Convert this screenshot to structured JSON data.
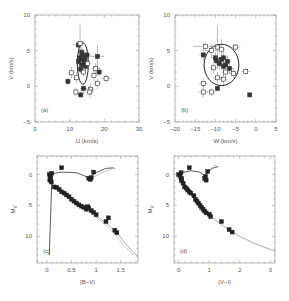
{
  "chart_data": [
    {
      "id": "a",
      "type": "scatter",
      "panel_label": "(a)",
      "xlabel": "U (km/s)",
      "ylabel": "V (km/s)",
      "xlim": [
        0,
        30
      ],
      "ylim": [
        -5,
        10
      ],
      "xticks": [
        0,
        10,
        20,
        30
      ],
      "yticks": [
        -5,
        0,
        5,
        10
      ],
      "box": {
        "left": 35,
        "top": 15,
        "right": 139,
        "bottom": 122
      },
      "ellipse": {
        "cx": 13.8,
        "cy": 3.2,
        "rx": 1.6,
        "ry": 2.9
      },
      "points": [
        {
          "x": 12.5,
          "y": 5.8,
          "ex": 1.5,
          "ey": 0.6,
          "filled": true
        },
        {
          "x": 13.0,
          "y": 6.0,
          "ex": 0.6,
          "ey": 2.6,
          "filled": false
        },
        {
          "x": 13.5,
          "y": 4.8,
          "ex": 0.8,
          "ey": 0.8,
          "filled": true
        },
        {
          "x": 14.0,
          "y": 4.2,
          "ex": 1.0,
          "ey": 0.7,
          "filled": true
        },
        {
          "x": 13.8,
          "y": 3.8,
          "ex": 0.9,
          "ey": 0.8,
          "filled": true
        },
        {
          "x": 14.2,
          "y": 3.4,
          "ex": 0.8,
          "ey": 0.6,
          "filled": true
        },
        {
          "x": 13.4,
          "y": 3.0,
          "ex": 0.7,
          "ey": 0.6,
          "filled": true
        },
        {
          "x": 14.6,
          "y": 2.8,
          "ex": 0.9,
          "ey": 0.7,
          "filled": true
        },
        {
          "x": 13.2,
          "y": 2.4,
          "ex": 0.8,
          "ey": 0.6,
          "filled": true
        },
        {
          "x": 14.0,
          "y": 2.0,
          "ex": 0.7,
          "ey": 0.6,
          "filled": false
        },
        {
          "x": 15.0,
          "y": 4.4,
          "ex": 1.2,
          "ey": 0.8,
          "filled": true
        },
        {
          "x": 18.0,
          "y": 4.2,
          "ex": 2.0,
          "ey": 1.6,
          "filled": true
        },
        {
          "x": 17.5,
          "y": 2.5,
          "ex": 1.2,
          "ey": 0.8,
          "filled": false
        },
        {
          "x": 18.5,
          "y": 2.0,
          "ex": 1.0,
          "ey": 0.7,
          "filled": true
        },
        {
          "x": 17.0,
          "y": 1.5,
          "ex": 1.0,
          "ey": 0.8,
          "filled": false
        },
        {
          "x": 20.5,
          "y": 1.1,
          "ex": 1.5,
          "ey": 0.6,
          "filled": false
        },
        {
          "x": 18.0,
          "y": 0.4,
          "ex": 1.0,
          "ey": 0.8,
          "filled": false
        },
        {
          "x": 10.5,
          "y": 1.9,
          "ex": 1.0,
          "ey": 0.8,
          "filled": false
        },
        {
          "x": 9.5,
          "y": 0.7,
          "ex": 0.8,
          "ey": 0.5,
          "filled": true
        },
        {
          "x": 12.0,
          "y": 1.2,
          "ex": 1.0,
          "ey": 0.8,
          "filled": false
        },
        {
          "x": 14.0,
          "y": -0.3,
          "ex": 1.0,
          "ey": 0.8,
          "filled": true
        },
        {
          "x": 16.0,
          "y": -0.4,
          "ex": 1.2,
          "ey": 0.8,
          "filled": false
        },
        {
          "x": 11.8,
          "y": -0.8,
          "ex": 0.8,
          "ey": 0.6,
          "filled": false
        },
        {
          "x": 13.2,
          "y": -1.2,
          "ex": 0.8,
          "ey": 0.5,
          "filled": true
        },
        {
          "x": 15.8,
          "y": -0.8,
          "ex": 1.0,
          "ey": 0.8,
          "filled": false
        },
        {
          "x": 12.8,
          "y": 4.0,
          "ex": 0.6,
          "ey": 0.5,
          "filled": true
        },
        {
          "x": 14.4,
          "y": 3.9,
          "ex": 0.6,
          "ey": 0.5,
          "filled": true
        },
        {
          "x": 13.6,
          "y": 4.5,
          "ex": 0.6,
          "ey": 0.5,
          "filled": true
        },
        {
          "x": 15.2,
          "y": 3.2,
          "ex": 0.8,
          "ey": 0.6,
          "filled": false
        },
        {
          "x": 12.6,
          "y": 3.5,
          "ex": 0.6,
          "ey": 0.5,
          "filled": true
        }
      ]
    },
    {
      "id": "b",
      "type": "scatter",
      "panel_label": "(b)",
      "xlabel": "W (km/s)",
      "ylabel": "V (km/s)",
      "xlim": [
        -20,
        5
      ],
      "ylim": [
        -5,
        10
      ],
      "xticks": [
        -20,
        -15,
        -10,
        -5,
        0,
        5
      ],
      "yticks": [
        -5,
        0,
        5,
        10
      ],
      "box": {
        "left": 175,
        "top": 15,
        "right": 276,
        "bottom": 122
      },
      "ellipse": {
        "cx": -8.5,
        "cy": 3.0,
        "rx": 4.3,
        "ry": 2.9
      },
      "points": [
        {
          "x": -9.5,
          "y": 5.5,
          "ex": 0.8,
          "ey": 3.0,
          "filled": false
        },
        {
          "x": -12.5,
          "y": 5.6,
          "ex": 3.0,
          "ey": 0.6,
          "filled": false
        },
        {
          "x": -11.0,
          "y": 5.0,
          "ex": 1.5,
          "ey": 1.0,
          "filled": false
        },
        {
          "x": -8.5,
          "y": 5.2,
          "ex": 1.0,
          "ey": 1.4,
          "filled": false
        },
        {
          "x": -5.0,
          "y": 5.5,
          "ex": 1.2,
          "ey": 0.5,
          "filled": false
        },
        {
          "x": -13.0,
          "y": 4.4,
          "ex": 1.0,
          "ey": 0.8,
          "filled": true
        },
        {
          "x": -10.0,
          "y": 4.0,
          "ex": 1.0,
          "ey": 0.8,
          "filled": true
        },
        {
          "x": -8.0,
          "y": 4.0,
          "ex": 1.0,
          "ey": 0.8,
          "filled": true
        },
        {
          "x": -7.0,
          "y": 3.5,
          "ex": 1.0,
          "ey": 0.8,
          "filled": true
        },
        {
          "x": -9.0,
          "y": 3.2,
          "ex": 1.0,
          "ey": 0.8,
          "filled": true
        },
        {
          "x": -8.0,
          "y": 2.8,
          "ex": 1.0,
          "ey": 0.8,
          "filled": true
        },
        {
          "x": -10.5,
          "y": 2.6,
          "ex": 1.0,
          "ey": 0.8,
          "filled": false
        },
        {
          "x": -6.5,
          "y": 2.5,
          "ex": 1.0,
          "ey": 0.8,
          "filled": true
        },
        {
          "x": -7.5,
          "y": 2.0,
          "ex": 1.0,
          "ey": 0.8,
          "filled": false
        },
        {
          "x": -5.5,
          "y": 1.8,
          "ex": 1.0,
          "ey": 0.7,
          "filled": false
        },
        {
          "x": -9.5,
          "y": 1.2,
          "ex": 1.0,
          "ey": 0.8,
          "filled": false
        },
        {
          "x": -8.0,
          "y": 1.0,
          "ex": 1.0,
          "ey": 0.8,
          "filled": false
        },
        {
          "x": -2.5,
          "y": 2.1,
          "ex": 1.0,
          "ey": 0.5,
          "filled": false
        },
        {
          "x": -13.0,
          "y": 0.4,
          "ex": 1.0,
          "ey": 0.7,
          "filled": false
        },
        {
          "x": -9.5,
          "y": -0.3,
          "ex": 0.3,
          "ey": 0.3,
          "filled": true
        },
        {
          "x": -13.0,
          "y": -0.8,
          "ex": 1.2,
          "ey": 0.8,
          "filled": false
        },
        {
          "x": -11.0,
          "y": -0.8,
          "ex": 1.0,
          "ey": 0.6,
          "filled": false
        },
        {
          "x": -1.5,
          "y": -1.2,
          "ex": 0.3,
          "ey": 0.3,
          "filled": true
        },
        {
          "x": -8.5,
          "y": 3.8,
          "ex": 0.8,
          "ey": 0.6,
          "filled": true
        },
        {
          "x": -7.5,
          "y": 3.0,
          "ex": 0.8,
          "ey": 0.6,
          "filled": true
        },
        {
          "x": -9.8,
          "y": 3.6,
          "ex": 0.8,
          "ey": 0.6,
          "filled": true
        }
      ]
    },
    {
      "id": "c",
      "type": "scatter",
      "panel_label": "(c)",
      "xlabel": "(B−V)",
      "ylabel": "M_V",
      "xlim": [
        -0.2,
        1.85
      ],
      "ylim": [
        -3,
        14.3
      ],
      "y_inverted": true,
      "xticks": [
        0,
        0.5,
        1,
        1.5
      ],
      "xtick_labels": [
        "0",
        "0.5",
        "1",
        "1.5"
      ],
      "yticks": [
        0,
        5,
        10
      ],
      "box": {
        "left": 37,
        "top": 156,
        "right": 138,
        "bottom": 263
      },
      "isochrones": [
        [
          [
            0.05,
            13.0
          ],
          [
            0.1,
            1.0
          ],
          [
            0.06,
            0.2
          ],
          [
            0.08,
            -0.1
          ],
          [
            0.3,
            -0.4
          ],
          [
            0.6,
            -0.3
          ],
          [
            0.85,
            0.5
          ],
          [
            1.0,
            -0.3
          ],
          [
            1.2,
            -1.0
          ],
          [
            1.35,
            -1.1
          ]
        ],
        [
          [
            0.07,
            1.3
          ],
          [
            0.2,
            2.2
          ],
          [
            0.4,
            3.3
          ],
          [
            0.6,
            4.5
          ],
          [
            0.8,
            5.6
          ],
          [
            1.0,
            6.6
          ],
          [
            1.2,
            7.8
          ],
          [
            1.4,
            9.2
          ],
          [
            1.6,
            11.2
          ],
          [
            1.85,
            13.4
          ]
        ],
        [
          [
            0.07,
            1.4
          ],
          [
            0.2,
            2.4
          ],
          [
            0.4,
            3.5
          ],
          [
            0.6,
            4.7
          ],
          [
            0.8,
            5.8
          ],
          [
            1.0,
            6.9
          ],
          [
            1.2,
            8.2
          ],
          [
            1.4,
            9.8
          ],
          [
            1.6,
            11.8
          ],
          [
            1.75,
            13.0
          ]
        ],
        [
          [
            0.9,
            0.6
          ],
          [
            1.1,
            -0.2
          ],
          [
            1.3,
            -0.9
          ],
          [
            1.4,
            -1.0
          ]
        ]
      ],
      "points": [
        {
          "x": 0.3,
          "y": -1.1
        },
        {
          "x": 0.05,
          "y": 0.0
        },
        {
          "x": 0.07,
          "y": 0.3
        },
        {
          "x": 0.08,
          "y": 0.6
        },
        {
          "x": 0.1,
          "y": -0.2
        },
        {
          "x": 0.06,
          "y": 0.9
        },
        {
          "x": 0.09,
          "y": 1.2
        },
        {
          "x": 0.15,
          "y": 2.0
        },
        {
          "x": 0.2,
          "y": 2.1
        },
        {
          "x": 0.25,
          "y": 2.4
        },
        {
          "x": 0.3,
          "y": 2.8
        },
        {
          "x": 0.35,
          "y": 3.0
        },
        {
          "x": 0.4,
          "y": 3.3
        },
        {
          "x": 0.45,
          "y": 3.6
        },
        {
          "x": 0.5,
          "y": 4.0
        },
        {
          "x": 0.55,
          "y": 4.3
        },
        {
          "x": 0.6,
          "y": 4.6
        },
        {
          "x": 0.65,
          "y": 4.9
        },
        {
          "x": 0.7,
          "y": 5.1
        },
        {
          "x": 0.75,
          "y": 5.3
        },
        {
          "x": 0.8,
          "y": 5.6
        },
        {
          "x": 0.85,
          "y": 5.4
        },
        {
          "x": 0.9,
          "y": 5.8
        },
        {
          "x": 0.95,
          "y": 6.1
        },
        {
          "x": 1.0,
          "y": 6.5
        },
        {
          "x": 0.83,
          "y": 5.2
        },
        {
          "x": 1.25,
          "y": 7.0
        },
        {
          "x": 1.2,
          "y": 7.6
        },
        {
          "x": 1.38,
          "y": 9.0
        },
        {
          "x": 1.42,
          "y": 9.4
        },
        {
          "x": 0.85,
          "y": 0.6
        },
        {
          "x": 0.88,
          "y": 0.8
        },
        {
          "x": 0.95,
          "y": -0.4
        },
        {
          "x": 0.9,
          "y": 0.5
        }
      ]
    },
    {
      "id": "d",
      "type": "scatter",
      "panel_label": "(d)",
      "xlabel": "(V−I)",
      "ylabel": "M_V",
      "xlim": [
        -0.15,
        3.15
      ],
      "ylim": [
        -3,
        14.3
      ],
      "y_inverted": true,
      "xticks": [
        0,
        1,
        2,
        3
      ],
      "xtick_labels": [
        "0",
        "1",
        "2",
        "3"
      ],
      "yticks": [
        0,
        5,
        10
      ],
      "box": {
        "left": 174,
        "top": 156,
        "right": 275,
        "bottom": 263
      },
      "isochrones": [
        [
          [
            0.05,
            1.3
          ],
          [
            0.02,
            0.3
          ],
          [
            0.1,
            -0.3
          ],
          [
            0.4,
            -0.6
          ],
          [
            0.7,
            -0.4
          ],
          [
            0.85,
            0.2
          ],
          [
            0.95,
            -0.3
          ],
          [
            1.1,
            -1.0
          ],
          [
            1.3,
            -1.3
          ]
        ],
        [
          [
            0.05,
            1.4
          ],
          [
            0.2,
            2.2
          ],
          [
            0.4,
            3.2
          ],
          [
            0.6,
            4.4
          ],
          [
            0.8,
            5.6
          ],
          [
            1.0,
            6.6
          ],
          [
            1.3,
            7.7
          ],
          [
            1.6,
            8.8
          ],
          [
            2.0,
            10.0
          ],
          [
            2.5,
            11.2
          ],
          [
            3.15,
            12.4
          ]
        ],
        [
          [
            0.95,
            -0.4
          ],
          [
            1.1,
            -1.2
          ],
          [
            1.25,
            -1.6
          ]
        ]
      ],
      "points": [
        {
          "x": 0.35,
          "y": -1.1
        },
        {
          "x": 0.0,
          "y": 0.0
        },
        {
          "x": 0.05,
          "y": 0.3
        },
        {
          "x": 0.1,
          "y": 0.6
        },
        {
          "x": 0.08,
          "y": -0.3
        },
        {
          "x": 0.1,
          "y": 1.0
        },
        {
          "x": 0.15,
          "y": 1.4
        },
        {
          "x": 0.2,
          "y": 2.0
        },
        {
          "x": 0.25,
          "y": 2.2
        },
        {
          "x": 0.3,
          "y": 2.5
        },
        {
          "x": 0.35,
          "y": 2.8
        },
        {
          "x": 0.4,
          "y": 3.0
        },
        {
          "x": 0.5,
          "y": 3.4
        },
        {
          "x": 0.55,
          "y": 4.0
        },
        {
          "x": 0.6,
          "y": 4.3
        },
        {
          "x": 0.65,
          "y": 4.6
        },
        {
          "x": 0.7,
          "y": 5.0
        },
        {
          "x": 0.75,
          "y": 5.3
        },
        {
          "x": 0.8,
          "y": 5.6
        },
        {
          "x": 0.85,
          "y": 5.9
        },
        {
          "x": 0.9,
          "y": 6.2
        },
        {
          "x": 1.0,
          "y": 6.4
        },
        {
          "x": 1.05,
          "y": 6.8
        },
        {
          "x": 1.4,
          "y": 7.6
        },
        {
          "x": 1.65,
          "y": 8.9
        },
        {
          "x": 1.75,
          "y": 9.3
        },
        {
          "x": 0.85,
          "y": 0.6
        },
        {
          "x": 0.9,
          "y": 0.9
        },
        {
          "x": 0.95,
          "y": -0.5
        },
        {
          "x": 0.88,
          "y": 0.3
        }
      ]
    }
  ]
}
